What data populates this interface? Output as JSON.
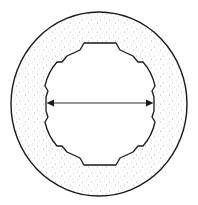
{
  "diagram": {
    "type": "cross-section",
    "colors": {
      "background": "#ffffff",
      "outline": "#1a1a1a",
      "stipple": "#b8b8b8"
    },
    "outer_ring": {
      "cx": 99,
      "cy": 104,
      "rx": 88,
      "ry": 92
    },
    "inner_bore": {
      "lobes": 8,
      "dimension_arrow": "diameter"
    },
    "annotations": []
  }
}
